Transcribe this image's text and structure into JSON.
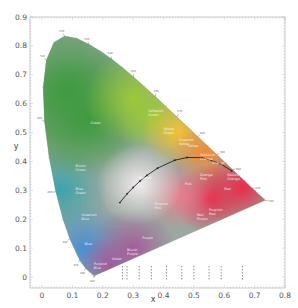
{
  "chart_data": {
    "type": "scatter",
    "xlabel": "x",
    "ylabel": "y",
    "xlim": [
      -0.05,
      0.8
    ],
    "ylim": [
      -0.05,
      0.9
    ],
    "x_ticks": [
      "0",
      "0.1",
      "0.2",
      "0.3",
      "0.4",
      "0.5",
      "0.6",
      "0.7",
      "0.8"
    ],
    "y_ticks": [
      "0",
      "0.1",
      "0.2",
      "0.3",
      "0.4",
      "0.5",
      "0.6",
      "0.7",
      "0.8",
      "0.9"
    ],
    "grid": false,
    "legend": "none",
    "spectral_locus": [
      [
        0.1741,
        0.005
      ],
      [
        0.1738,
        0.0049
      ],
      [
        0.1733,
        0.0048
      ],
      [
        0.1726,
        0.0048
      ],
      [
        0.1714,
        0.0051
      ],
      [
        0.1689,
        0.0069
      ],
      [
        0.1644,
        0.0109
      ],
      [
        0.1566,
        0.0177
      ],
      [
        0.144,
        0.0297
      ],
      [
        0.1241,
        0.0578
      ],
      [
        0.0913,
        0.1327
      ],
      [
        0.0687,
        0.2007
      ],
      [
        0.0454,
        0.295
      ],
      [
        0.0235,
        0.4127
      ],
      [
        0.0082,
        0.5384
      ],
      [
        0.0039,
        0.6548
      ],
      [
        0.0139,
        0.7502
      ],
      [
        0.0389,
        0.812
      ],
      [
        0.0743,
        0.8338
      ],
      [
        0.1142,
        0.8262
      ],
      [
        0.1547,
        0.8059
      ],
      [
        0.1929,
        0.7816
      ],
      [
        0.2296,
        0.7543
      ],
      [
        0.2658,
        0.7243
      ],
      [
        0.3016,
        0.6923
      ],
      [
        0.3373,
        0.6589
      ],
      [
        0.3731,
        0.6245
      ],
      [
        0.4087,
        0.5896
      ],
      [
        0.4441,
        0.5547
      ],
      [
        0.4788,
        0.5202
      ],
      [
        0.5125,
        0.4866
      ],
      [
        0.5448,
        0.4544
      ],
      [
        0.5752,
        0.4242
      ],
      [
        0.6029,
        0.3965
      ],
      [
        0.627,
        0.3725
      ],
      [
        0.6482,
        0.3514
      ],
      [
        0.6658,
        0.334
      ],
      [
        0.6801,
        0.3197
      ],
      [
        0.6915,
        0.3083
      ],
      [
        0.7006,
        0.2993
      ],
      [
        0.7079,
        0.292
      ],
      [
        0.714,
        0.2859
      ],
      [
        0.719,
        0.2809
      ],
      [
        0.723,
        0.277
      ],
      [
        0.726,
        0.274
      ],
      [
        0.7283,
        0.2717
      ],
      [
        0.73,
        0.27
      ],
      [
        0.7347,
        0.2653
      ]
    ],
    "planckian_locus": [
      [
        0.2565,
        0.2577
      ],
      [
        0.2806,
        0.2883
      ],
      [
        0.3003,
        0.3101
      ],
      [
        0.3221,
        0.3318
      ],
      [
        0.3451,
        0.3516
      ],
      [
        0.3805,
        0.3768
      ],
      [
        0.4369,
        0.4041
      ],
      [
        0.4776,
        0.4137
      ],
      [
        0.5266,
        0.4133
      ],
      [
        0.5857,
        0.3931
      ],
      [
        0.6247,
        0.3674
      ]
    ],
    "region_labels": [
      {
        "name": "Green",
        "x": 0.16,
        "y": 0.53
      },
      {
        "name": "Yellowish Green",
        "x": 0.35,
        "y": 0.57
      },
      {
        "name": "Yellow Green",
        "x": 0.4,
        "y": 0.51
      },
      {
        "name": "Greenish Yellow",
        "x": 0.45,
        "y": 0.47
      },
      {
        "name": "Yellow",
        "x": 0.48,
        "y": 0.45
      },
      {
        "name": "Yellowish Orange",
        "x": 0.52,
        "y": 0.42
      },
      {
        "name": "Orange",
        "x": 0.56,
        "y": 0.39
      },
      {
        "name": "Reddish Orange",
        "x": 0.61,
        "y": 0.35
      },
      {
        "name": "Red",
        "x": 0.6,
        "y": 0.3
      },
      {
        "name": "Pink",
        "x": 0.47,
        "y": 0.32
      },
      {
        "name": "Orange Pink",
        "x": 0.52,
        "y": 0.35
      },
      {
        "name": "Purplish Pink",
        "x": 0.37,
        "y": 0.25
      },
      {
        "name": "Red Purple",
        "x": 0.51,
        "y": 0.21
      },
      {
        "name": "Purplish Red",
        "x": 0.55,
        "y": 0.23
      },
      {
        "name": "Purple",
        "x": 0.33,
        "y": 0.13
      },
      {
        "name": "Bluish Purple",
        "x": 0.28,
        "y": 0.09
      },
      {
        "name": "Violet",
        "x": 0.23,
        "y": 0.06
      },
      {
        "name": "Purplish Blue",
        "x": 0.17,
        "y": 0.04
      },
      {
        "name": "Blue",
        "x": 0.14,
        "y": 0.11
      },
      {
        "name": "Greenish Blue",
        "x": 0.13,
        "y": 0.21
      },
      {
        "name": "Bluish Green",
        "x": 0.11,
        "y": 0.38
      },
      {
        "name": "Blue Green",
        "x": 0.11,
        "y": 0.3
      },
      {
        "name": "Neutral",
        "x": 0.32,
        "y": 0.34
      }
    ],
    "wavelength_marks": [
      {
        "nm": "380",
        "x": 0.1741,
        "y": 0.005
      },
      {
        "nm": "460",
        "x": 0.144,
        "y": 0.0297
      },
      {
        "nm": "470",
        "x": 0.1241,
        "y": 0.0578
      },
      {
        "nm": "480",
        "x": 0.0913,
        "y": 0.1327
      },
      {
        "nm": "490",
        "x": 0.0454,
        "y": 0.295
      },
      {
        "nm": "500",
        "x": 0.0082,
        "y": 0.5384
      },
      {
        "nm": "510",
        "x": 0.0139,
        "y": 0.7502
      },
      {
        "nm": "520",
        "x": 0.0743,
        "y": 0.8338
      },
      {
        "nm": "530",
        "x": 0.1547,
        "y": 0.8059
      },
      {
        "nm": "540",
        "x": 0.2296,
        "y": 0.7543
      },
      {
        "nm": "550",
        "x": 0.3016,
        "y": 0.6923
      },
      {
        "nm": "560",
        "x": 0.3731,
        "y": 0.6245
      },
      {
        "nm": "570",
        "x": 0.4441,
        "y": 0.5547
      },
      {
        "nm": "580",
        "x": 0.5125,
        "y": 0.4866
      },
      {
        "nm": "590",
        "x": 0.5752,
        "y": 0.4242
      },
      {
        "nm": "600",
        "x": 0.627,
        "y": 0.3725
      },
      {
        "nm": "620",
        "x": 0.6915,
        "y": 0.3083
      },
      {
        "nm": "700",
        "x": 0.7347,
        "y": 0.2653
      }
    ],
    "bottom_markers_x": [
      0.265,
      0.28,
      0.32,
      0.36,
      0.41,
      0.46,
      0.5,
      0.55,
      0.59,
      0.66
    ]
  },
  "axes": {
    "x_title": "x",
    "y_title": "y"
  },
  "colors": {
    "green": "#4a9a45",
    "yellow": "#f0c030",
    "orange": "#f08a30",
    "red": "#e8324a",
    "purple": "#a0609a",
    "blue": "#4a8fd0",
    "cyan": "#3ca5b0",
    "white": "#f4eef0",
    "frame": "#999999",
    "locus_line": "#222222"
  }
}
